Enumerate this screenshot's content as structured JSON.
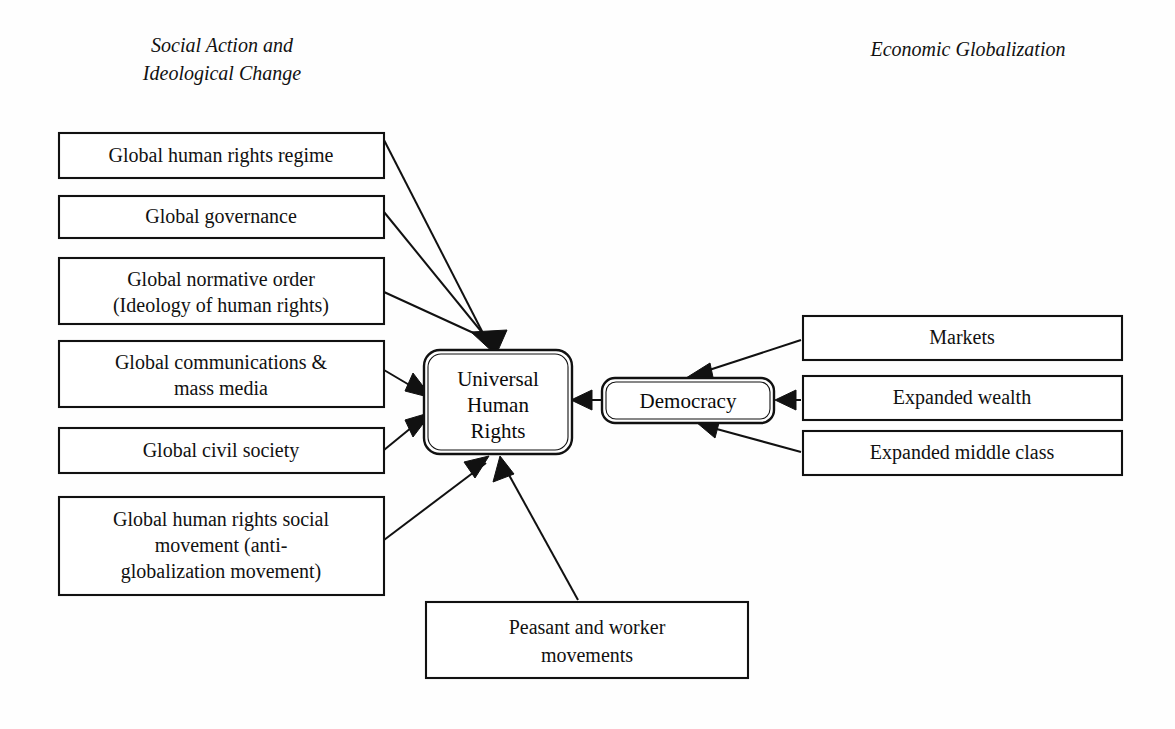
{
  "headings": {
    "left": {
      "line1": "Social Action and",
      "line2": "Ideological Change"
    },
    "right": {
      "line1": "Economic Globalization"
    }
  },
  "center_node": {
    "line1": "Universal",
    "line2": "Human",
    "line3": "Rights"
  },
  "intermediate_node": {
    "label": "Democracy"
  },
  "left_boxes": [
    {
      "line1": "Global human rights regime",
      "line2": "",
      "line3": ""
    },
    {
      "line1": "Global governance",
      "line2": "",
      "line3": ""
    },
    {
      "line1": "Global normative order",
      "line2": "(Ideology of human rights)",
      "line3": ""
    },
    {
      "line1": "Global communications &",
      "line2": "mass media",
      "line3": ""
    },
    {
      "line1": "Global civil society",
      "line2": "",
      "line3": ""
    },
    {
      "line1": "Global human rights social",
      "line2": "movement (anti-",
      "line3": "globalization movement)"
    }
  ],
  "right_boxes": [
    {
      "line1": "Markets"
    },
    {
      "line1": "Expanded wealth"
    },
    {
      "line1": "Expanded middle class"
    }
  ],
  "bottom_box": {
    "line1": "Peasant and worker",
    "line2": "movements"
  },
  "colors": {
    "background": "#ffffff",
    "stroke": "#111111",
    "text": "#111111"
  }
}
